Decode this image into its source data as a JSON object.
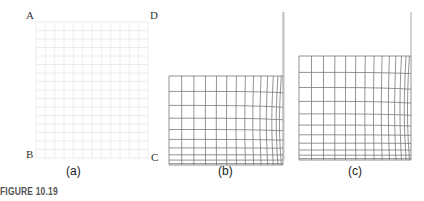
{
  "figure": {
    "label": "FIGURE 10.19",
    "corner_labels": {
      "A": "A",
      "B": "B",
      "C": "C",
      "D": "D"
    },
    "panels": [
      {
        "id": "a",
        "caption": "(a)",
        "description": "undeformed grid (faint)"
      },
      {
        "id": "b",
        "caption": "(b)",
        "description": "deformed mesh, compressed toward bottom and right"
      },
      {
        "id": "c",
        "caption": "(c)",
        "description": "deformed mesh, taller, compressed toward bottom and right"
      }
    ],
    "colors": {
      "grid": "#555555",
      "faint_grid": "#e6e6e6",
      "text": "#333333"
    }
  }
}
